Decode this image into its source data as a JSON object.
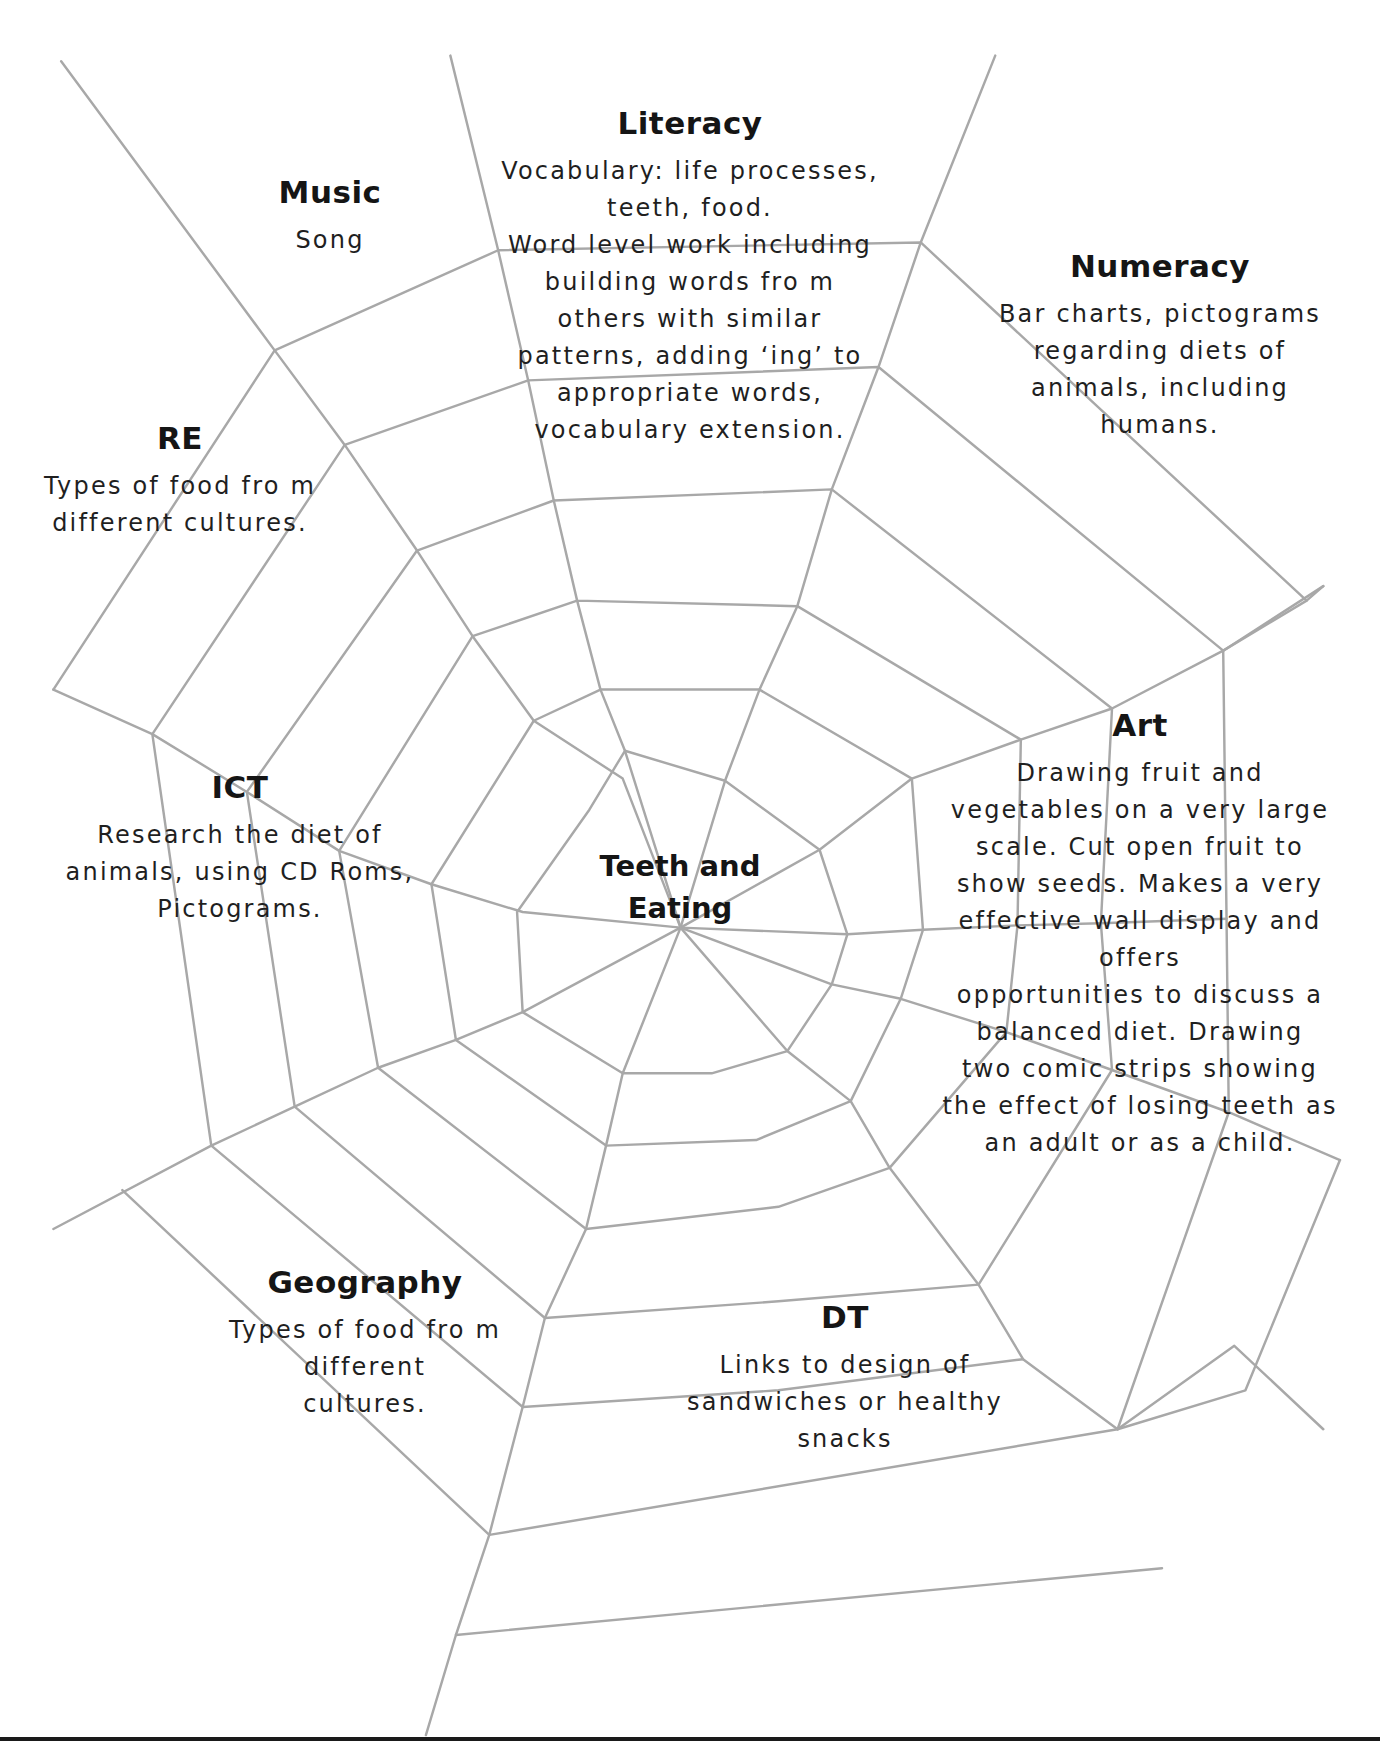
{
  "center": {
    "title": "Teeth and\nEating"
  },
  "sections": {
    "literacy": {
      "title": "Literacy",
      "body": "Vocabulary: life processes,\nteeth, food.\nWord level work including\nbuilding words fro m\nothers with similar\npatterns, adding ‘ing’ to\nappropriate words,\nvocabulary extension."
    },
    "music": {
      "title": "Music",
      "body": "Song"
    },
    "numeracy": {
      "title": "Numeracy",
      "body": "Bar charts, pictograms\nregarding diets of\nanimals, including\nhumans."
    },
    "re": {
      "title": "RE",
      "body": "Types of food fro m\ndifferent cultures."
    },
    "ict": {
      "title": "ICT",
      "body": "Research the diet of\nanimals, using CD Roms,\nPictograms."
    },
    "art": {
      "title": "Art",
      "body": "Drawing fruit and\nvegetables on a very large\nscale.  Cut open fruit to\nshow seeds.  Makes a very\neffective wall display and\noffers\nopportunities to discuss a\nbalanced diet.  Drawing\ntwo comic strips showing\nthe effect of losing teeth as\nan adult or as a child."
    },
    "geography": {
      "title": "Geography",
      "body": "Types of food fro m\ndifferent\ncultures."
    },
    "dt": {
      "title": "DT",
      "body": "Links to design of\nsandwiches or healthy\nsnacks"
    }
  },
  "colors": {
    "web_line": "#a8a8a8",
    "text": "#1a1a1a",
    "background": "#ffffff"
  }
}
